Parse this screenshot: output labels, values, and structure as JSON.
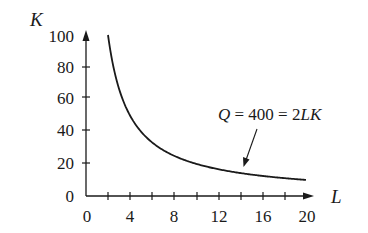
{
  "chart_data": {
    "type": "line",
    "title": "",
    "xlabel": "L",
    "ylabel": "K",
    "xlim": [
      0,
      20
    ],
    "ylim": [
      0,
      100
    ],
    "grid": false,
    "legend": "none",
    "x_ticks": [
      "0",
      "4",
      "8",
      "12",
      "16",
      "20"
    ],
    "x_minor_ticks": [
      2,
      6,
      10,
      14,
      18
    ],
    "y_ticks": [
      "0",
      "20",
      "40",
      "60",
      "80",
      "100"
    ],
    "series": [
      {
        "name": "Q = 400 = 2LK",
        "equation": "K = 200 / L",
        "x": [
          2,
          2.5,
          3,
          4,
          5,
          6,
          8,
          10,
          12,
          14,
          16,
          18,
          20
        ],
        "values": [
          100,
          80,
          66.7,
          50,
          40,
          33.3,
          25,
          20,
          16.7,
          14.3,
          12.5,
          11.1,
          10
        ]
      }
    ],
    "annotations": [
      {
        "text": "Q = 400 = 2LK",
        "points_to": {
          "x": 14,
          "y": 14.3
        }
      }
    ]
  },
  "labels": {
    "x_axis": "L",
    "y_axis": "K",
    "annotation_q": "Q",
    "annotation_rest": " = 400 = 2",
    "annotation_lk": "LK",
    "x_tick_0": "0",
    "x_tick_4": "4",
    "x_tick_8": "8",
    "x_tick_12": "12",
    "x_tick_16": "16",
    "x_tick_20": "20",
    "y_tick_0": "0",
    "y_tick_20": "20",
    "y_tick_40": "40",
    "y_tick_60": "60",
    "y_tick_80": "80",
    "y_tick_100": "100"
  }
}
